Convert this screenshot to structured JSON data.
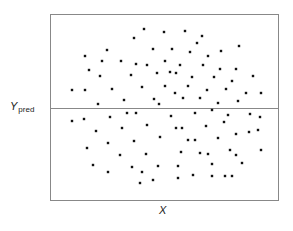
{
  "chart_data": {
    "type": "scatter",
    "title": "",
    "xlabel": "X",
    "ylabel": "Y",
    "ylabel_subscript": "pred",
    "grid": false,
    "legend": null,
    "reference_line": {
      "orientation": "horizontal",
      "y_px": 108,
      "label": "Y_pred"
    },
    "plot_box_px": {
      "left": 50,
      "top": 14,
      "right": 279,
      "bottom": 200
    },
    "points_px": [
      [
        144,
        29
      ],
      [
        164,
        32
      ],
      [
        185,
        31
      ],
      [
        202,
        36
      ],
      [
        134,
        38
      ],
      [
        197,
        43
      ],
      [
        153,
        49
      ],
      [
        172,
        49
      ],
      [
        107,
        50
      ],
      [
        190,
        52
      ],
      [
        239,
        46
      ],
      [
        221,
        51
      ],
      [
        85,
        56
      ],
      [
        208,
        56
      ],
      [
        102,
        61
      ],
      [
        121,
        61
      ],
      [
        165,
        61
      ],
      [
        136,
        64
      ],
      [
        147,
        65
      ],
      [
        180,
        65
      ],
      [
        203,
        65
      ],
      [
        89,
        70
      ],
      [
        220,
        69
      ],
      [
        170,
        72
      ],
      [
        157,
        73
      ],
      [
        236,
        69
      ],
      [
        176,
        73
      ],
      [
        131,
        75
      ],
      [
        100,
        76
      ],
      [
        214,
        77
      ],
      [
        192,
        77
      ],
      [
        253,
        76
      ],
      [
        232,
        81
      ],
      [
        142,
        87
      ],
      [
        165,
        86
      ],
      [
        188,
        86
      ],
      [
        112,
        89
      ],
      [
        72,
        90
      ],
      [
        85,
        90
      ],
      [
        226,
        89
      ],
      [
        175,
        93
      ],
      [
        207,
        90
      ],
      [
        246,
        93
      ],
      [
        261,
        93
      ],
      [
        200,
        98
      ],
      [
        124,
        100
      ],
      [
        154,
        99
      ],
      [
        183,
        98
      ],
      [
        238,
        101
      ],
      [
        218,
        103
      ],
      [
        159,
        104
      ],
      [
        98,
        104
      ],
      [
        212,
        110
      ],
      [
        127,
        113
      ],
      [
        136,
        113
      ],
      [
        228,
        115
      ],
      [
        195,
        113
      ],
      [
        171,
        116
      ],
      [
        110,
        117
      ],
      [
        250,
        114
      ],
      [
        260,
        117
      ],
      [
        72,
        121
      ],
      [
        84,
        119
      ],
      [
        224,
        122
      ],
      [
        147,
        125
      ],
      [
        206,
        126
      ],
      [
        122,
        128
      ],
      [
        176,
        128
      ],
      [
        182,
        128
      ],
      [
        96,
        131
      ],
      [
        258,
        130
      ],
      [
        249,
        132
      ],
      [
        236,
        134
      ],
      [
        160,
        137
      ],
      [
        218,
        138
      ],
      [
        134,
        141
      ],
      [
        188,
        140
      ],
      [
        195,
        140
      ],
      [
        108,
        143
      ],
      [
        87,
        148
      ],
      [
        230,
        150
      ],
      [
        181,
        152
      ],
      [
        200,
        153
      ],
      [
        146,
        154
      ],
      [
        208,
        154
      ],
      [
        120,
        155
      ],
      [
        236,
        155
      ],
      [
        261,
        150
      ],
      [
        242,
        163
      ],
      [
        93,
        165
      ],
      [
        212,
        164
      ],
      [
        158,
        166
      ],
      [
        178,
        166
      ],
      [
        132,
        167
      ],
      [
        142,
        172
      ],
      [
        108,
        172
      ],
      [
        193,
        175
      ],
      [
        178,
        178
      ],
      [
        212,
        176
      ],
      [
        225,
        176
      ],
      [
        232,
        176
      ],
      [
        153,
        180
      ],
      [
        140,
        183
      ]
    ],
    "note": "Residual-style scatter: points randomly distributed above and below a horizontal predicted-value line, no trend with X"
  },
  "labels": {
    "y_main": "Y",
    "y_sub": "pred",
    "x": "X"
  },
  "colors": {
    "axis": "#888888",
    "point": "#111111",
    "text": "#222222"
  }
}
